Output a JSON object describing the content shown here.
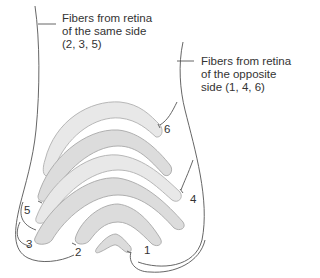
{
  "diagram": {
    "labels": {
      "same_side": {
        "line1": "Fibers from retina",
        "line2": "of the same side",
        "line3": "(2, 3, 5)"
      },
      "opposite_side": {
        "line1": "Fibers from retina",
        "line2": "of the opposite",
        "line3": "side (1, 4, 6)"
      }
    },
    "layer_numbers": {
      "l1": "1",
      "l2": "2",
      "l3": "3",
      "l4": "4",
      "l5": "5",
      "l6": "6"
    },
    "colors": {
      "outline": "#555555",
      "layer_fill": "#dcdcdc",
      "layer_stroke": "#a8a8a8",
      "text": "#333333"
    }
  }
}
